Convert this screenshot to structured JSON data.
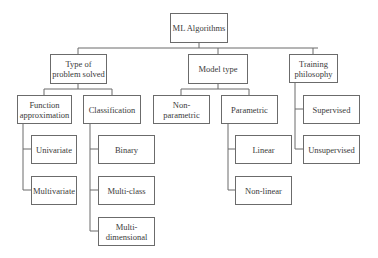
{
  "diagram": {
    "type": "tree",
    "root": {
      "label": "ML Algorithms"
    },
    "categories": [
      {
        "label": "Type of problem solved",
        "children": [
          {
            "label": "Function approximation",
            "children": [
              "Univariate",
              "Multivariate"
            ]
          },
          {
            "label": "Classification",
            "children": [
              "Binary",
              "Multi-class",
              "Multi-dimensional"
            ]
          }
        ]
      },
      {
        "label": "Model type",
        "children": [
          {
            "label": "Non-parametric",
            "children": []
          },
          {
            "label": "Parametric",
            "children": [
              "Linear",
              "Non-linear"
            ]
          }
        ]
      },
      {
        "label": "Training philosophy",
        "children": [
          "Supervised",
          "Unsupervised"
        ]
      }
    ]
  },
  "nodes": {
    "root": "ML Algorithms",
    "problem": "Type of problem solved",
    "model": "Model type",
    "training": "Training philosophy",
    "funcapprox": "Function approximation",
    "classification": "Classification",
    "nonparametric": "Non-parametric",
    "parametric": "Parametric",
    "supervised": "Supervised",
    "unsupervised": "Unsupervised",
    "univariate": "Univariate",
    "multivariate": "Multivariate",
    "binary": "Binary",
    "multiclass": "Multi-class",
    "multidimensional": "Multi-dimensional",
    "linear": "Linear",
    "nonlinear": "Non-linear"
  }
}
